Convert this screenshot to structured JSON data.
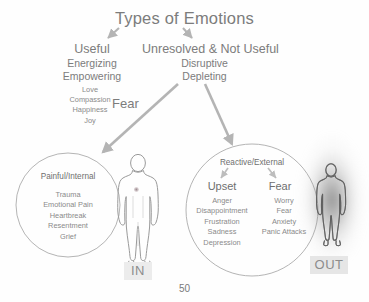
{
  "title": "Types of Emotions",
  "columns": {
    "useful": {
      "heading": "Useful",
      "subs": [
        "Energizing",
        "Empowering"
      ],
      "emotions": [
        "Love",
        "Compassion",
        "Happiness",
        "Joy"
      ],
      "side_label": "Fear"
    },
    "unresolved": {
      "heading": "Unresolved & Not Useful",
      "subs": [
        "Disruptive",
        "Depleting"
      ]
    }
  },
  "left_circle": {
    "title": "Painful/Internal",
    "items": [
      "Trauma",
      "Emotional Pain",
      "Heartbreak",
      "Resentment",
      "Grief"
    ]
  },
  "right_circle": {
    "title": "Reactive/External",
    "branches": [
      {
        "heading": "Upset",
        "items": [
          "Anger",
          "Disappointment",
          "Frustration",
          "Sadness",
          "Depression"
        ]
      },
      {
        "heading": "Fear",
        "items": [
          "Worry",
          "Fear",
          "Anxiety",
          "Panic Attacks"
        ]
      }
    ]
  },
  "figures": {
    "in_label": "IN",
    "out_label": "OUT"
  },
  "page_number": "50",
  "colors": {
    "text": "#7c7c7c",
    "text_light": "#8a8a8a",
    "stroke": "#a8a8a8",
    "arrow": "#b0b0b0",
    "label_bg": "#ececec"
  }
}
